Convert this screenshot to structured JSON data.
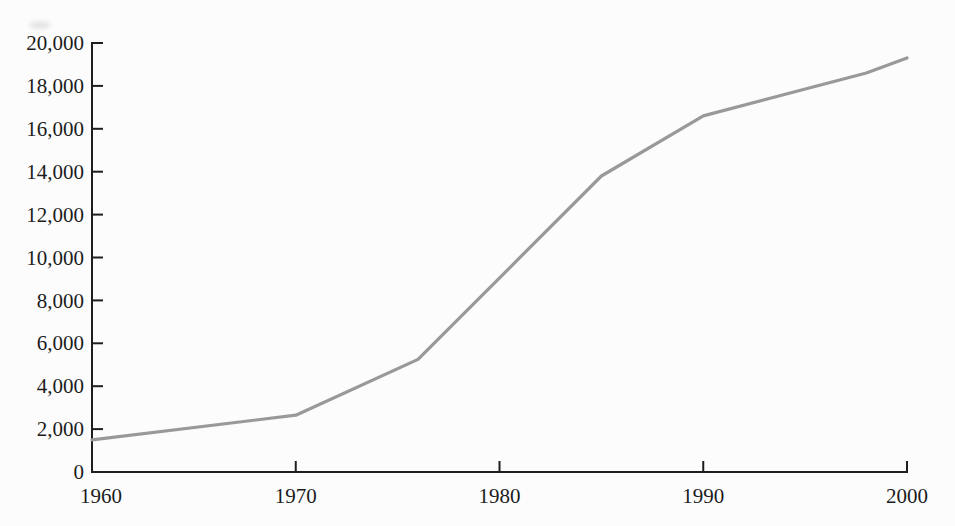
{
  "figure": {
    "background": "#fcfcfc",
    "axis_color": "#1e1e1e",
    "label_color": "#1c1c1c"
  },
  "chart_data": {
    "type": "line",
    "title": "",
    "xlabel": "",
    "ylabel": "",
    "x": [
      1960,
      1970,
      1976,
      1985,
      1990,
      1998,
      2000
    ],
    "values": [
      1500,
      2650,
      5250,
      13800,
      16600,
      18600,
      19300
    ],
    "xlim": [
      1960,
      2000
    ],
    "ylim": [
      0,
      20000
    ],
    "x_ticks": [
      1960,
      1970,
      1980,
      1990,
      2000
    ],
    "x_tick_labels": [
      "1960",
      "1970",
      "1980",
      "1990",
      "2000"
    ],
    "y_ticks": [
      0,
      2000,
      4000,
      6000,
      8000,
      10000,
      12000,
      14000,
      16000,
      18000,
      20000
    ],
    "y_tick_labels": [
      "0",
      "2,000",
      "4,000",
      "6,000",
      "8,000",
      "10,000",
      "12,000",
      "14,000",
      "16,000",
      "18,000",
      "20,000"
    ],
    "grid": false,
    "legend": false,
    "line_color": "#999999",
    "line_width": 3.2
  }
}
